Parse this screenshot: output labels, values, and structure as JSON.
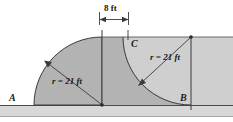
{
  "figure": {
    "labels": {
      "point_a": "A",
      "point_b": "B",
      "point_c": "C",
      "radius_left": "r = 21 ft",
      "radius_right": "r = 21 ft",
      "dimension_top": "8 ft"
    },
    "colors": {
      "shaded_fill": "#b3b3b3",
      "light_fill": "#cfcfcf",
      "ground_fill": "#d8d8d8",
      "outline": "#3a3a3a",
      "text": "#1a1a1a"
    },
    "dimensions": {
      "left_radius_value": "21",
      "right_radius_value": "21",
      "top_span_value": "8",
      "units": "ft"
    }
  }
}
